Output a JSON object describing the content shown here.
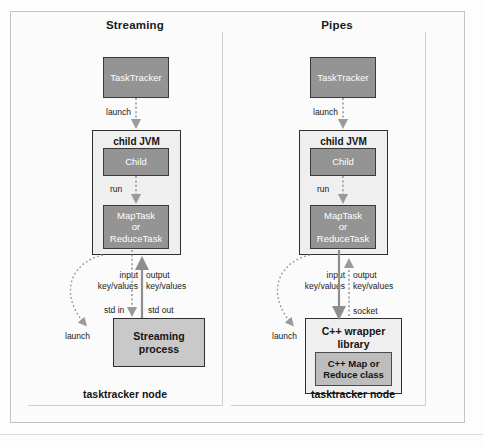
{
  "figure": {
    "width": 483,
    "height": 446,
    "background_color": "#fdfdfd",
    "frame_color": "#c3c3c3"
  },
  "colors": {
    "box_dark_fill": "#949494",
    "box_dark_border": "#3a3a3a",
    "box_mid_fill": "#c9c9c9",
    "box_inner_fill": "#bdbdbd",
    "container_fill": "#efefef",
    "container_border": "#2f2f2f",
    "arrow_solid": "#8e8e8e",
    "arrow_dotted": "#9a9a9a",
    "text_dark": "#141414",
    "text_light": "#ffffff"
  },
  "panels": [
    {
      "id": "streaming",
      "title": "Streaming",
      "footer_label": "tasktracker node",
      "boxes": {
        "tasktracker": "TaskTracker",
        "child_jvm": "child JVM",
        "child": "Child",
        "task_line1": "MapTask",
        "task_line2": "or",
        "task_line3": "ReduceTask",
        "process_line1": "Streaming",
        "process_line2": "process"
      },
      "edge_labels": {
        "launch_top": "launch",
        "run": "run",
        "input": "input",
        "input2": "key/values",
        "output": "output",
        "output2": "key/values",
        "std_in": "std in",
        "std_out": "std out",
        "launch_curve": "launch"
      }
    },
    {
      "id": "pipes",
      "title": "Pipes",
      "footer_label": "tasktracker node",
      "boxes": {
        "tasktracker": "TaskTracker",
        "child_jvm": "child JVM",
        "child": "Child",
        "task_line1": "MapTask",
        "task_line2": "or",
        "task_line3": "ReduceTask",
        "wrapper_line1": "C++ wrapper",
        "wrapper_line2": "library",
        "inner_line1": "C++ Map or",
        "inner_line2": "Reduce class"
      },
      "edge_labels": {
        "launch_top": "launch",
        "run": "run",
        "input": "input",
        "input2": "key/values",
        "output": "output",
        "output2": "key/values",
        "socket": "socket",
        "launch_curve": "launch"
      }
    }
  ]
}
